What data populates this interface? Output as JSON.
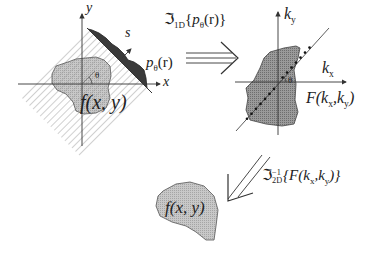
{
  "figure": {
    "colors": {
      "object_fill": "#bdbdbd",
      "spectrum_fill": "#8e8e8e",
      "projection_fill": "#3a3a3a",
      "line": "#333333",
      "hatch": "#8a8a8a"
    }
  },
  "left_panel": {
    "y_axis_label": "y",
    "x_axis_label": "x",
    "s_axis_label": "s",
    "projection_label": "p",
    "projection_sub": "θ",
    "projection_arg": "(r)",
    "angle_label": "θ",
    "object_label": "f(x, y)"
  },
  "transform_1d": {
    "symbol": "ℑ",
    "sub": "1D",
    "arg_open": "{",
    "arg_p": "p",
    "arg_sub": "θ",
    "arg_r": "(r)",
    "arg_close": "}"
  },
  "right_panel": {
    "ky_label_k": "k",
    "ky_label_sub": "y",
    "kx_label_k": "k",
    "kx_label_sub": "x",
    "angle_label": "θ",
    "spectrum_label_F": "F(k",
    "spectrum_sub_x": "x",
    "spectrum_mid": ",k",
    "spectrum_sub_y": "y",
    "spectrum_close": ")"
  },
  "transform_2d_inverse": {
    "symbol": "ℑ",
    "sup": "−1",
    "sub": "2D",
    "arg": "{F(k",
    "sub_x": "x",
    "mid": ",k",
    "sub_y": "y",
    "close": ")}"
  },
  "bottom": {
    "object_label": "f(x, y)"
  }
}
